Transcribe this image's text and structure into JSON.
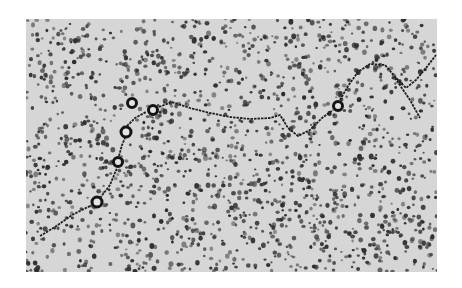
{
  "image": {
    "kind": "electron micrograph",
    "subject": "DNA strand with bead-like ring particles on granular background",
    "frame": {
      "left": 26,
      "top": 19,
      "width": 411,
      "height": 253
    },
    "colors": {
      "page_background": "#ffffff",
      "field": "#d6d6d6",
      "grain": "#2e2e2e",
      "strand": "#1e1e1e",
      "ring": "#141414"
    },
    "rings": [
      {
        "x": 132,
        "y": 103,
        "r": 6
      },
      {
        "x": 153,
        "y": 110,
        "r": 6
      },
      {
        "x": 126,
        "y": 132,
        "r": 6.5
      },
      {
        "x": 118,
        "y": 162,
        "r": 6
      },
      {
        "x": 97,
        "y": 202,
        "r": 6.5
      },
      {
        "x": 338,
        "y": 106,
        "r": 6
      }
    ],
    "strands": [
      [
        [
          40,
          236
        ],
        [
          55,
          227
        ],
        [
          72,
          215
        ],
        [
          90,
          206
        ]
      ],
      [
        [
          100,
          198
        ],
        [
          110,
          185
        ],
        [
          117,
          168
        ]
      ],
      [
        [
          119,
          156
        ],
        [
          122,
          145
        ],
        [
          125,
          138
        ]
      ],
      [
        [
          127,
          126
        ],
        [
          135,
          118
        ],
        [
          146,
          112
        ]
      ],
      [
        [
          159,
          107
        ],
        [
          172,
          102
        ],
        [
          190,
          108
        ],
        [
          210,
          113
        ],
        [
          230,
          117
        ],
        [
          250,
          119
        ],
        [
          270,
          118
        ],
        [
          280,
          115
        ],
        [
          288,
          128
        ],
        [
          298,
          136
        ],
        [
          310,
          130
        ],
        [
          322,
          118
        ],
        [
          333,
          110
        ]
      ],
      [
        [
          340,
          100
        ],
        [
          348,
          86
        ],
        [
          358,
          72
        ],
        [
          370,
          64
        ],
        [
          385,
          65
        ],
        [
          396,
          78
        ],
        [
          406,
          88
        ],
        [
          416,
          80
        ],
        [
          426,
          68
        ],
        [
          436,
          55
        ]
      ],
      [
        [
          395,
          78
        ],
        [
          410,
          100
        ],
        [
          420,
          118
        ]
      ]
    ],
    "grain_count": 1700,
    "grain_seed": 7
  }
}
